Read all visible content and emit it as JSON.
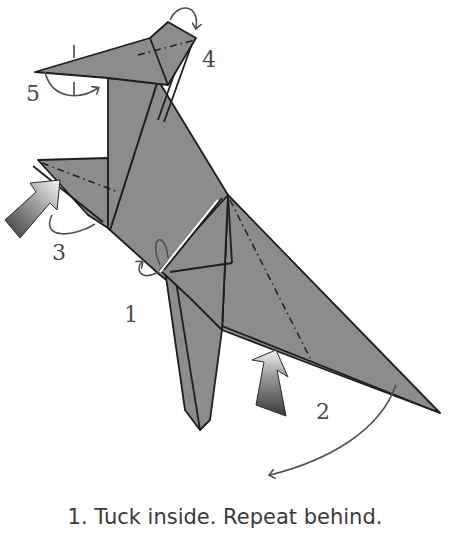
{
  "diagram": {
    "paper_color": "#8c8c8c",
    "line_color": "#1e1e1e",
    "arrow_color": "#505050",
    "step_labels": [
      {
        "id": "1",
        "text": "1"
      },
      {
        "id": "2",
        "text": "2"
      },
      {
        "id": "3",
        "text": "3"
      },
      {
        "id": "4",
        "text": "4"
      },
      {
        "id": "5",
        "text": "5"
      }
    ]
  },
  "caption": {
    "text": "1. Tuck inside. Repeat behind."
  }
}
